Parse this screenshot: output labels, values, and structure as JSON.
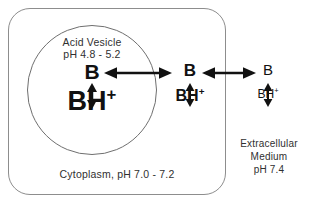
{
  "diagram": {
    "background_color": "#ffffff",
    "line_color": "#111111",
    "outline_color": "#8d8d8d"
  },
  "compartments": {
    "cytoplasm": {
      "name": "Cytoplasm",
      "label": "Cytoplasm, pH 7.0 - 7.2",
      "ph_range": "7.0 - 7.2"
    },
    "vesicle": {
      "name": "Acid Vesicle",
      "label_line1": "Acid Vesicle",
      "label_line2": "pH 4.8 - 5.2",
      "ph_range": "4.8 - 5.2"
    },
    "extracellular": {
      "name": "Extracellular Medium",
      "label_line1": "Extracellular",
      "label_line2": "Medium",
      "label_line3": "pH 7.4",
      "ph": "7.4"
    }
  },
  "species": {
    "base_symbol": "B",
    "acid_symbol": "BH",
    "acid_charge": "+"
  },
  "columns": [
    {
      "id": "vesicle",
      "location": "Acid Vesicle",
      "base": "B",
      "acid": "BH",
      "charge": "+",
      "relative_amount": "large"
    },
    {
      "id": "cytoplasm",
      "location": "Cytoplasm",
      "base": "B",
      "acid": "BH",
      "charge": "+",
      "relative_amount": "medium"
    },
    {
      "id": "extracellular",
      "location": "Extracellular Medium",
      "base": "B",
      "acid": "BH",
      "charge": "+",
      "relative_amount": "small"
    }
  ],
  "arrows": {
    "horizontal": [
      {
        "id": "vesicle-cytoplasm",
        "type": "double-headed",
        "connects": "B (vesicle) <-> B (cytoplasm)"
      },
      {
        "id": "cytoplasm-extracellular",
        "type": "double-headed",
        "connects": "B (cytoplasm) <-> B (extracellular)"
      }
    ],
    "vertical": [
      {
        "id": "vesicle-equilibrium",
        "type": "double-headed",
        "connects": "B <-> BH+ (vesicle)"
      },
      {
        "id": "cytoplasm-equilibrium",
        "type": "double-headed",
        "connects": "B <-> BH+ (cytoplasm)"
      },
      {
        "id": "extracellular-equilibrium",
        "type": "double-headed",
        "connects": "B <-> BH+ (extracellular)"
      }
    ]
  }
}
